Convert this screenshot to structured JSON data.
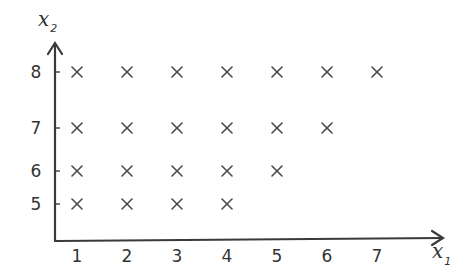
{
  "chart_data": {
    "type": "scatter",
    "title": "",
    "xlabel": "x1",
    "ylabel": "x2",
    "x_ticks": [
      1,
      2,
      3,
      4,
      5,
      6,
      7
    ],
    "y_ticks": [
      5,
      6,
      7,
      8
    ],
    "marker": "x",
    "grid": false,
    "legend": null,
    "points": [
      {
        "x": 1,
        "y": 8
      },
      {
        "x": 2,
        "y": 8
      },
      {
        "x": 3,
        "y": 8
      },
      {
        "x": 4,
        "y": 8
      },
      {
        "x": 5,
        "y": 8
      },
      {
        "x": 6,
        "y": 8
      },
      {
        "x": 7,
        "y": 8
      },
      {
        "x": 1,
        "y": 7
      },
      {
        "x": 2,
        "y": 7
      },
      {
        "x": 3,
        "y": 7
      },
      {
        "x": 4,
        "y": 7
      },
      {
        "x": 5,
        "y": 7
      },
      {
        "x": 6,
        "y": 7
      },
      {
        "x": 1,
        "y": 6
      },
      {
        "x": 2,
        "y": 6
      },
      {
        "x": 3,
        "y": 6
      },
      {
        "x": 4,
        "y": 6
      },
      {
        "x": 5,
        "y": 6
      },
      {
        "x": 1,
        "y": 5
      },
      {
        "x": 2,
        "y": 5
      },
      {
        "x": 3,
        "y": 5
      },
      {
        "x": 4,
        "y": 5
      }
    ]
  },
  "axes": {
    "x_label_main": "x",
    "x_label_sub": "1",
    "y_label_main": "x",
    "y_label_sub": "2"
  },
  "colors": {
    "ink": "#3a3a3a",
    "background": "#ffffff"
  }
}
